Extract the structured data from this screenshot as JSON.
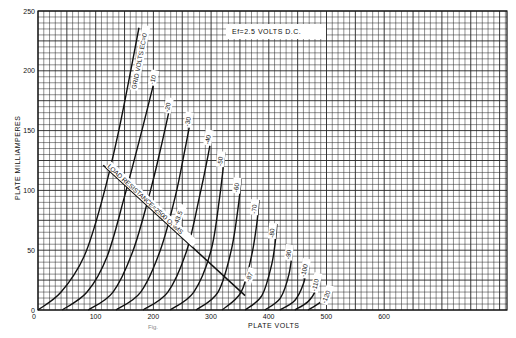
{
  "chart_data": {
    "type": "line",
    "title": "",
    "annotation": "Ef=2.5 VOLTS D.C.",
    "xlabel": "PLATE VOLTS",
    "ylabel": "PLATE MILLIAMPERES",
    "xlim": [
      0,
      810
    ],
    "ylim": [
      0,
      250
    ],
    "grid": true,
    "x_ticks": [
      0,
      100,
      200,
      300,
      400,
      500,
      600
    ],
    "y_ticks": [
      0,
      50,
      100,
      150,
      200,
      250
    ],
    "family_label": "GRID VOLTS EC=0",
    "series": [
      {
        "name": "Ec=0",
        "label": "GRID VOLTS EC=0",
        "points": [
          [
            0,
            0
          ],
          [
            40,
            15
          ],
          [
            80,
            45
          ],
          [
            110,
            90
          ],
          [
            140,
            150
          ],
          [
            175,
            236
          ]
        ]
      },
      {
        "name": "Ec=-10",
        "label": "-10",
        "points": [
          [
            42,
            0
          ],
          [
            85,
            15
          ],
          [
            120,
            45
          ],
          [
            150,
            95
          ],
          [
            180,
            150
          ],
          [
            206,
            200
          ]
        ]
      },
      {
        "name": "Ec=-20",
        "label": "-20",
        "points": [
          [
            87,
            0
          ],
          [
            130,
            15
          ],
          [
            165,
            50
          ],
          [
            195,
            100
          ],
          [
            215,
            140
          ],
          [
            232,
            177
          ]
        ]
      },
      {
        "name": "Ec=-30",
        "label": "-30",
        "points": [
          [
            135,
            0
          ],
          [
            178,
            15
          ],
          [
            212,
            50
          ],
          [
            238,
            95
          ],
          [
            255,
            135
          ],
          [
            267,
            165
          ]
        ]
      },
      {
        "name": "Ec=-40",
        "label": "-40",
        "points": [
          [
            182,
            0
          ],
          [
            225,
            15
          ],
          [
            258,
            50
          ],
          [
            280,
            95
          ],
          [
            295,
            130
          ],
          [
            302,
            150
          ]
        ]
      },
      {
        "name": "Ec=-50",
        "label": "-50",
        "points": [
          [
            229,
            0
          ],
          [
            270,
            15
          ],
          [
            300,
            50
          ],
          [
            315,
            95
          ],
          [
            324,
            132
          ]
        ]
      },
      {
        "name": "Ec=-60",
        "label": "-60",
        "points": [
          [
            274,
            0
          ],
          [
            312,
            15
          ],
          [
            335,
            50
          ],
          [
            348,
            90
          ],
          [
            352,
            110
          ]
        ]
      },
      {
        "name": "Ec=-70",
        "label": "-70",
        "points": [
          [
            319,
            0
          ],
          [
            352,
            15
          ],
          [
            370,
            45
          ],
          [
            380,
            75
          ],
          [
            383,
            92
          ]
        ]
      },
      {
        "name": "Ec=-80",
        "label": "-80",
        "points": [
          [
            359,
            0
          ],
          [
            388,
            12
          ],
          [
            405,
            38
          ],
          [
            412,
            60
          ],
          [
            414,
            72
          ]
        ]
      },
      {
        "name": "Ec=-90",
        "label": "-90",
        "points": [
          [
            393,
            0
          ],
          [
            420,
            10
          ],
          [
            435,
            30
          ],
          [
            442,
            54
          ]
        ]
      },
      {
        "name": "Ec=-100",
        "label": "-100",
        "points": [
          [
            419,
            0
          ],
          [
            445,
            8
          ],
          [
            460,
            22
          ],
          [
            468,
            39
          ]
        ]
      },
      {
        "name": "Ec=-110",
        "label": "-110",
        "points": [
          [
            445,
            0
          ],
          [
            468,
            7
          ],
          [
            482,
            17
          ],
          [
            487,
            27
          ]
        ]
      },
      {
        "name": "Ec=-120",
        "label": "-120",
        "points": [
          [
            468,
            0
          ],
          [
            488,
            6
          ],
          [
            500,
            12
          ],
          [
            504,
            17
          ]
        ]
      }
    ],
    "load_line": {
      "label": "LOAD RESISTANCE=2500 OHMS",
      "points": [
        [
          113,
          121
        ],
        [
          359,
          12
        ]
      ],
      "markers": [
        {
          "label": "-43.5",
          "at": [
            235,
            67
          ]
        },
        {
          "label": "-87",
          "at": [
            360,
            20
          ]
        }
      ]
    }
  },
  "caption": "Fig."
}
